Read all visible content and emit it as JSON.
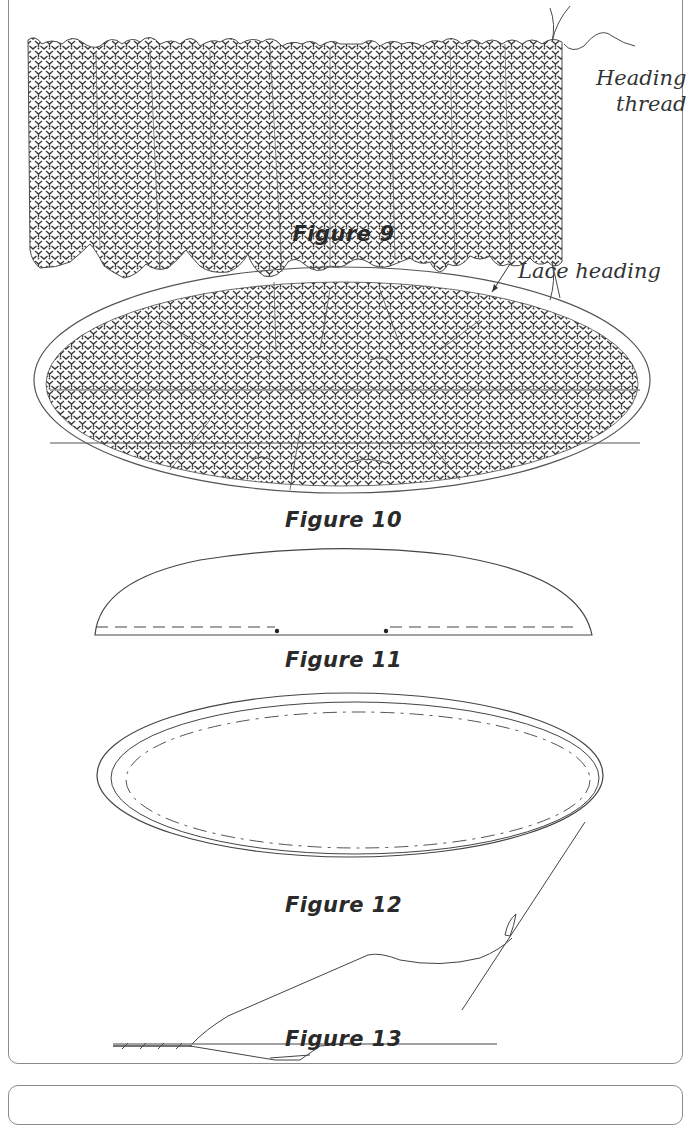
{
  "figures": [
    {
      "id": "fig9",
      "caption": "Figure 9",
      "labels": [
        "Heading",
        "thread"
      ]
    },
    {
      "id": "fig10",
      "caption": "Figure 10",
      "labels": [
        "Lace heading"
      ]
    },
    {
      "id": "fig11",
      "caption": "Figure 11"
    },
    {
      "id": "fig12",
      "caption": "Figure 12"
    },
    {
      "id": "fig13",
      "caption": "Figure 13"
    }
  ],
  "colors": {
    "line": "#4a4a4a",
    "lace": "#3a3a3a",
    "border": "#8a8a8a"
  }
}
